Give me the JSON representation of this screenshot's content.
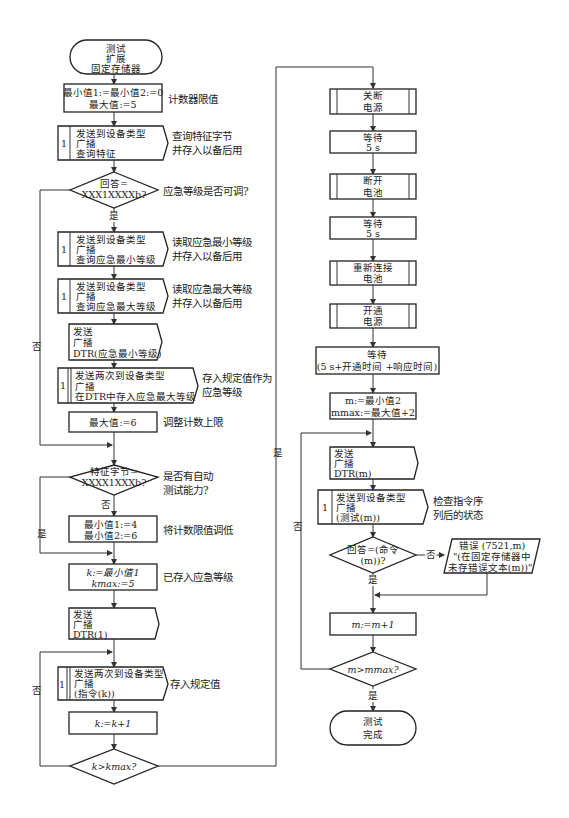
{
  "left": {
    "start": {
      "lines": [
        "测试",
        "扩展",
        "固定存储器"
      ]
    },
    "init": {
      "lines": [
        "最小值1:=最小值2:=0",
        "最大值:=5"
      ],
      "note": "计数器限值"
    },
    "query_features": {
      "num": "1",
      "lines": [
        "发送到设备类型",
        "广播",
        "查询特征"
      ],
      "note": [
        "查询特征字节",
        "并存入以备后用"
      ]
    },
    "decision1": {
      "lines": [
        "回答=",
        "XXX1XXXXb?"
      ],
      "note": "应急等级是否可调?",
      "yes": "是",
      "no": "否"
    },
    "query_min": {
      "num": "1",
      "lines": [
        "发送到设备类型",
        "广播",
        "查询应急最小等级"
      ],
      "note": [
        "读取应急最小等级",
        "并存入以备后用"
      ]
    },
    "query_max": {
      "num": "1",
      "lines": [
        "发送到设备类型",
        "广播",
        "查询应急最大等级"
      ],
      "note": [
        "读取应急最大等级",
        "并存入以备后用"
      ]
    },
    "send_dtr_min": {
      "lines": [
        "发送",
        "广播",
        "DTR(应急最小等级)"
      ]
    },
    "store_max": {
      "num": "1",
      "lines": [
        "发送两次到设备类型",
        "广播",
        "在DTR中存入应急最大等级"
      ],
      "note": [
        "存入规定值作为",
        "应急等级"
      ]
    },
    "set_max6": {
      "lines": [
        "最大值:=6"
      ],
      "note": "调整计数上限"
    },
    "decision2": {
      "lines": [
        "特征字节=",
        "XXXX1XXXb?"
      ],
      "note": [
        "是否有自动",
        "测试能力?"
      ],
      "yes": "是",
      "no": "否"
    },
    "set_min": {
      "lines": [
        "最小值1:=4",
        "最小值2:=6"
      ],
      "note": "将计数限值调低"
    },
    "set_k": {
      "lines": [
        "k:=最小值1",
        "kmax:=5"
      ],
      "note": "已存入应急等级"
    },
    "send_dtr1": {
      "lines": [
        "发送",
        "广播",
        "DTR(1)"
      ]
    },
    "store_cmd": {
      "num": "1",
      "lines": [
        "发送两次到设备类型",
        "广播",
        "(指令(k))"
      ],
      "note": "存入规定值"
    },
    "inc_k": {
      "lines": [
        "k:=k+1"
      ]
    },
    "decision3": {
      "lines": [
        "k>kmax?"
      ],
      "yes": "是",
      "no": "否"
    }
  },
  "right": {
    "power_off": {
      "lines": [
        "关断",
        "电源"
      ]
    },
    "wait1": {
      "lines": [
        "等待",
        "5 s"
      ]
    },
    "battery_off": {
      "lines": [
        "断开",
        "电池"
      ]
    },
    "wait2": {
      "lines": [
        "等待",
        "5 s"
      ]
    },
    "battery_on": {
      "lines": [
        "重新连接",
        "电池"
      ]
    },
    "power_on": {
      "lines": [
        "开通",
        "电源"
      ]
    },
    "wait3": {
      "lines": [
        "等待",
        "(5 s+开通时间 +响应时间)"
      ]
    },
    "set_m": {
      "lines": [
        "m:=最小值2",
        "mmax:=最大值+2"
      ]
    },
    "send_dtr_m": {
      "lines": [
        "发送",
        "广播",
        "DTR(m)"
      ]
    },
    "test_m": {
      "num": "1",
      "lines": [
        "发送到设备类型",
        "广播",
        "(测试(m))"
      ],
      "note": [
        "检查指令序",
        "列后的状态"
      ]
    },
    "decision4": {
      "lines": [
        "回答=(命令",
        "(m))?"
      ],
      "yes": "是",
      "no": "否"
    },
    "error": {
      "lines": [
        "错误 (7521,m)",
        "\"(在固定存储器中",
        "未存错误文本(m))\""
      ]
    },
    "inc_m": {
      "lines": [
        "m:=m+1"
      ]
    },
    "decision5": {
      "lines": [
        "m>mmax?"
      ],
      "yes": "是",
      "no": "否"
    },
    "end": {
      "lines": [
        "测试",
        "完成"
      ]
    }
  }
}
